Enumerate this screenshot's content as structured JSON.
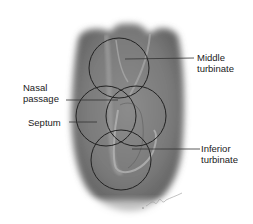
{
  "diagram": {
    "labels": [
      {
        "id": "middle-turbinate",
        "lines": [
          "Middle",
          "turbinate"
        ]
      },
      {
        "id": "nasal-passage",
        "lines": [
          "Nasal",
          "passage"
        ]
      },
      {
        "id": "septum",
        "lines": [
          "Septum"
        ]
      },
      {
        "id": "inferior-turbinate",
        "lines": [
          "Inferior",
          "turbinate"
        ]
      }
    ],
    "signature": "artist signature",
    "colors": {
      "tissue_dark": "#6e6e6e",
      "tissue_mid": "#8a8a8a",
      "circle_stroke": "#222222",
      "leader_line": "#333333",
      "background": "#ffffff"
    }
  }
}
